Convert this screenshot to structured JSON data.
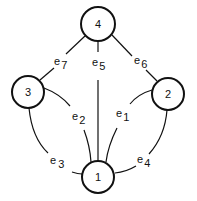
{
  "diagram": {
    "type": "graph",
    "nodes": [
      {
        "id": "1",
        "label": "1"
      },
      {
        "id": "2",
        "label": "2"
      },
      {
        "id": "3",
        "label": "3"
      },
      {
        "id": "4",
        "label": "4"
      }
    ],
    "edges": [
      {
        "id": "e1",
        "base": "e",
        "sub": "1",
        "from": "2",
        "to": "1"
      },
      {
        "id": "e2",
        "base": "e",
        "sub": "2",
        "from": "3",
        "to": "1"
      },
      {
        "id": "e3",
        "base": "e",
        "sub": "3",
        "from": "3",
        "to": "1"
      },
      {
        "id": "e4",
        "base": "e",
        "sub": "4",
        "from": "2",
        "to": "1"
      },
      {
        "id": "e5",
        "base": "e",
        "sub": "5",
        "from": "4",
        "to": "1"
      },
      {
        "id": "e6",
        "base": "e",
        "sub": "6",
        "from": "4",
        "to": "2"
      },
      {
        "id": "e7",
        "base": "e",
        "sub": "7",
        "from": "4",
        "to": "3"
      }
    ]
  }
}
